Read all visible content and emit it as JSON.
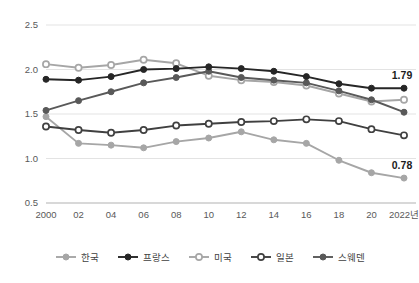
{
  "chart_data": {
    "type": "line",
    "title": "",
    "subtitle": "",
    "xlabel": "",
    "ylabel": "",
    "x": [
      2000,
      2002,
      2004,
      2006,
      2008,
      2010,
      2012,
      2014,
      2016,
      2018,
      2020,
      2022
    ],
    "xtick_labels": [
      "2000",
      "02",
      "04",
      "06",
      "08",
      "10",
      "12",
      "14",
      "16",
      "18",
      "20",
      "2022년"
    ],
    "ytick_labels": [
      "2.5",
      "2.0",
      "1.5",
      "1.0",
      "0.5"
    ],
    "yticks": [
      2.5,
      2.0,
      1.5,
      1.0,
      0.5
    ],
    "ylim": [
      0.5,
      2.5
    ],
    "grid": true,
    "legend_position": "bottom",
    "series": [
      {
        "name": "한국",
        "color": "#a6a6a6",
        "marker": "filled-circle",
        "values": [
          1.47,
          1.17,
          1.15,
          1.12,
          1.19,
          1.23,
          1.3,
          1.21,
          1.17,
          0.98,
          0.84,
          0.78
        ]
      },
      {
        "name": "프랑스",
        "color": "#262626",
        "marker": "filled-circle",
        "values": [
          1.89,
          1.88,
          1.92,
          2.0,
          2.01,
          2.03,
          2.01,
          1.98,
          1.92,
          1.84,
          1.79,
          1.79
        ]
      },
      {
        "name": "미국",
        "color": "#a6a6a6",
        "marker": "hollow-circle",
        "values": [
          2.06,
          2.02,
          2.05,
          2.11,
          2.07,
          1.93,
          1.88,
          1.86,
          1.82,
          1.73,
          1.64,
          1.66
        ]
      },
      {
        "name": "일본",
        "color": "#404040",
        "marker": "hollow-circle",
        "values": [
          1.36,
          1.32,
          1.29,
          1.32,
          1.37,
          1.39,
          1.41,
          1.42,
          1.44,
          1.42,
          1.33,
          1.26
        ]
      },
      {
        "name": "스웨덴",
        "color": "#595959",
        "marker": "filled-circle",
        "values": [
          1.54,
          1.65,
          1.75,
          1.85,
          1.91,
          1.98,
          1.91,
          1.88,
          1.85,
          1.76,
          1.66,
          1.52
        ]
      }
    ],
    "annotations": [
      {
        "text": "1.79",
        "series": "프랑스",
        "x": 2022,
        "y": 1.79
      },
      {
        "text": "0.78",
        "series": "한국",
        "x": 2022,
        "y": 0.78
      }
    ]
  },
  "legend": {
    "items": [
      {
        "label": "한국"
      },
      {
        "label": "프랑스"
      },
      {
        "label": "미국"
      },
      {
        "label": "일본"
      },
      {
        "label": "스웨덴"
      }
    ]
  }
}
